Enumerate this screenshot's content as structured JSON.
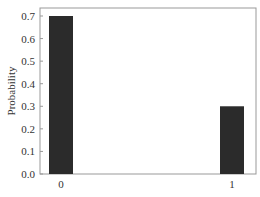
{
  "chart_data": {
    "type": "bar",
    "title": "",
    "xlabel": "",
    "ylabel": "Probability",
    "categories": [
      "0",
      "1"
    ],
    "values": [
      0.7,
      0.3
    ],
    "ylim": [
      0.0,
      0.7
    ],
    "yticks": [
      "0.0",
      "0.1",
      "0.2",
      "0.3",
      "0.4",
      "0.5",
      "0.6",
      "0.7"
    ],
    "xticks": [
      "0",
      "1"
    ],
    "grid": false,
    "legend": null,
    "bar_color": "#2b2b2b",
    "frame_color": "#999999"
  }
}
